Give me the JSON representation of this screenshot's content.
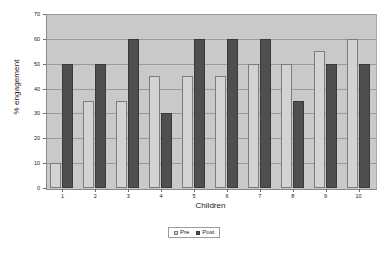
{
  "chart_data": {
    "type": "bar",
    "title": "",
    "xlabel": "Children",
    "ylabel": "% engagement",
    "categories": [
      "1",
      "2",
      "3",
      "4",
      "5",
      "6",
      "7",
      "8",
      "9",
      "10"
    ],
    "series": [
      {
        "name": "Pre",
        "color": "#d3d3d3",
        "values": [
          10,
          35,
          35,
          45,
          45,
          45,
          50,
          50,
          55,
          60
        ]
      },
      {
        "name": "Post",
        "color": "#4f4f4f",
        "values": [
          50,
          50,
          60,
          30,
          60,
          60,
          60,
          35,
          50,
          50
        ]
      }
    ],
    "ylim": [
      0,
      70
    ],
    "ytick_values": [
      0,
      10,
      20,
      30,
      40,
      50,
      60,
      70
    ],
    "ytick_labels": [
      "0",
      "10",
      "20",
      "30",
      "40",
      "50",
      "60",
      "70"
    ],
    "grid": true,
    "legend_position": "bottom",
    "plot_background": "#c9c9c9",
    "figure_background": "#ffffff"
  },
  "legend": {
    "entries": [
      {
        "label": "Pre"
      },
      {
        "label": "Post"
      }
    ]
  }
}
